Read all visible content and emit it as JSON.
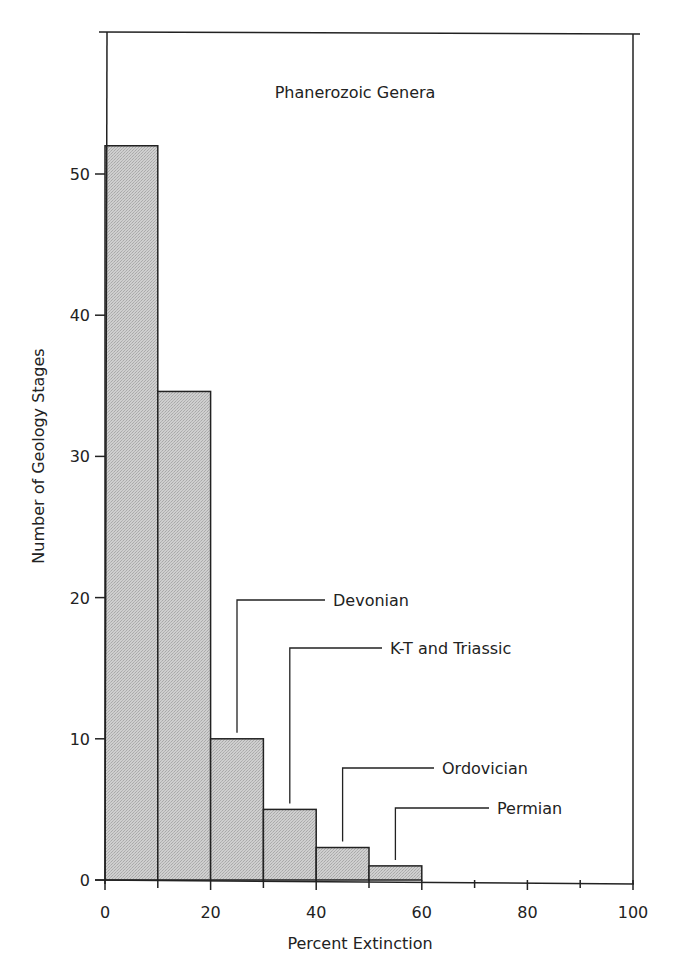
{
  "chart_data": {
    "type": "bar",
    "title": "Phanerozoic Genera",
    "xlabel": "Percent Extinction",
    "ylabel": "Number of Geology Stages",
    "xlim": [
      0,
      100
    ],
    "ylim": [
      0,
      60
    ],
    "x_ticks": [
      0,
      20,
      40,
      60,
      80,
      100
    ],
    "x_minor_ticks": [
      10,
      30,
      50,
      70,
      90
    ],
    "y_ticks": [
      0,
      10,
      20,
      30,
      40,
      50
    ],
    "grid": false,
    "legend": null,
    "bins": [
      {
        "range": [
          0,
          10
        ],
        "value": 52
      },
      {
        "range": [
          10,
          20
        ],
        "value": 34.6
      },
      {
        "range": [
          20,
          30
        ],
        "value": 10
      },
      {
        "range": [
          30,
          40
        ],
        "value": 5
      },
      {
        "range": [
          40,
          50
        ],
        "value": 2.3
      },
      {
        "range": [
          50,
          60
        ],
        "value": 1
      }
    ],
    "categories": [
      "0-10",
      "10-20",
      "20-30",
      "30-40",
      "40-50",
      "50-60"
    ],
    "values": [
      52,
      34.6,
      10,
      5,
      2.3,
      1
    ],
    "annotations": [
      {
        "label": "Devonian",
        "x": 25,
        "bar_index": 2
      },
      {
        "label": "K-T and Triassic",
        "x": 35,
        "bar_index": 3
      },
      {
        "label": "Ordovician",
        "x": 45,
        "bar_index": 4
      },
      {
        "label": "Permian",
        "x": 55,
        "bar_index": 5
      }
    ]
  },
  "colors": {
    "bar_fill": "#c8c8c8",
    "stroke": "#222222",
    "background": "#ffffff"
  }
}
